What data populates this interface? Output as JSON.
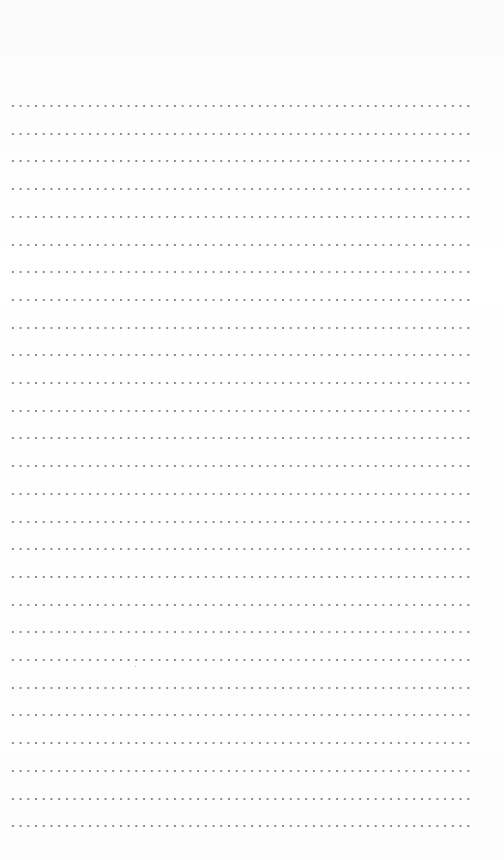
{
  "page": {
    "type": "dotted-ruled-sheet",
    "background_color": "#fdfdfd",
    "dot_color": "#8c8c8c",
    "line_count": 27,
    "first_line_y": 106,
    "line_pitch": 27.7,
    "line_left_x": 9,
    "line_width": 460,
    "dot_pitch": 7.72
  }
}
